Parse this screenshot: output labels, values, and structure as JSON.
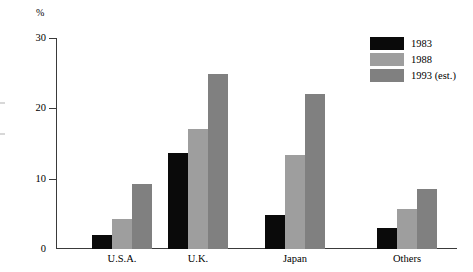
{
  "chart_data": {
    "type": "bar",
    "title": "",
    "xlabel": "",
    "ylabel": "%",
    "unit_label": "%",
    "ylim": [
      0,
      30
    ],
    "yticks": [
      0,
      10,
      20,
      30
    ],
    "ytick_labels": [
      "0",
      "10",
      "20",
      "30"
    ],
    "grid": false,
    "legend_position": "top-right",
    "categories": [
      "U.S.A.",
      "U.K.",
      "Japan",
      "Others"
    ],
    "series": [
      {
        "name": "1983",
        "color": "#0a0a0a",
        "values": [
          2.0,
          13.6,
          4.8,
          3.0
        ]
      },
      {
        "name": "1988",
        "color": "#9e9e9e",
        "values": [
          4.2,
          17.0,
          13.4,
          5.7
        ]
      },
      {
        "name": "1993 (est.)",
        "color": "#808080",
        "values": [
          9.2,
          24.9,
          22.1,
          8.5
        ]
      }
    ]
  },
  "legend": {
    "entries": [
      {
        "label": "1983"
      },
      {
        "label": "1988"
      },
      {
        "label": "1993 (est.)"
      }
    ]
  }
}
